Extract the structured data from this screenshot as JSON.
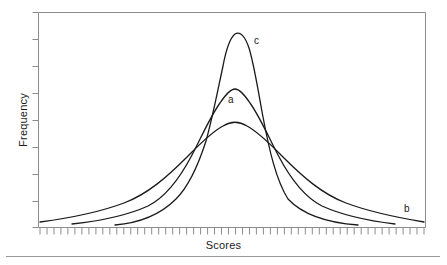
{
  "figure": {
    "background_color": "#ffffff",
    "line_color": "#1a1a1a",
    "frame_color": "#8c8c8c",
    "rule_color": "#9a9a9a"
  },
  "axes": {
    "ylabel": "Frequency",
    "xlabel": "Scores"
  },
  "labels": {
    "a": "a",
    "b": "b",
    "c": "c"
  },
  "chart_data": {
    "type": "line",
    "title": "",
    "subtitle": "",
    "xlabel": "Scores",
    "ylabel": "Frequency",
    "xlim": [
      0,
      100
    ],
    "ylim": [
      0,
      100
    ],
    "grid": false,
    "legend": "inline-curve-labels",
    "x_tick_labels": [],
    "y_tick_labels": [],
    "x_tick_count": 56,
    "y_tick_count": 8,
    "annotations": [
      {
        "text": "c",
        "x": 57.5,
        "y": 88,
        "note": "leptokurtic curve label"
      },
      {
        "text": "a",
        "x": 50.5,
        "y": 62,
        "note": "mesokurtic curve label"
      },
      {
        "text": "b",
        "x": 95.5,
        "y": 12,
        "note": "platykurtic curve label"
      }
    ],
    "crossover_points": [
      {
        "x": 40.5,
        "y": 38
      },
      {
        "x": 61.5,
        "y": 38
      }
    ],
    "series": [
      {
        "name": "a",
        "description": "mesokurtic normal distribution, medium peak",
        "peak": {
          "x": 51,
          "y": 71
        },
        "x": [
          9,
          14,
          19,
          24,
          28,
          32,
          36,
          40,
          44,
          47,
          51,
          55,
          59,
          63,
          67,
          71,
          75,
          79,
          84,
          89,
          93
        ],
        "values": [
          2,
          3,
          5,
          7,
          10,
          15,
          22,
          33,
          48,
          63,
          71,
          63,
          48,
          33,
          22,
          15,
          10,
          7,
          5,
          3,
          2
        ]
      },
      {
        "name": "b",
        "description": "platykurtic distribution, flat broad peak and heavy tails",
        "peak": {
          "x": 51,
          "y": 55
        },
        "x": [
          1,
          7,
          13,
          19,
          25,
          30,
          35,
          40,
          44,
          47,
          51,
          55,
          59,
          63,
          68,
          73,
          78,
          83,
          89,
          95,
          99
        ],
        "values": [
          5,
          7,
          10,
          14,
          19,
          25,
          31,
          38,
          47,
          53,
          55,
          53,
          47,
          38,
          31,
          25,
          19,
          14,
          10,
          7,
          5
        ]
      },
      {
        "name": "c",
        "description": "leptokurtic distribution, tall narrow peak and light tails",
        "peak": {
          "x": 51,
          "y": 95
        },
        "x": [
          20,
          25,
          29,
          33,
          36,
          39,
          42,
          45,
          47,
          49,
          51,
          53,
          55,
          58,
          61,
          64,
          67,
          70,
          74,
          78,
          83
        ],
        "values": [
          1,
          2,
          4,
          8,
          14,
          23,
          36,
          55,
          75,
          90,
          95,
          90,
          75,
          55,
          36,
          23,
          14,
          8,
          4,
          2,
          1
        ]
      }
    ]
  }
}
